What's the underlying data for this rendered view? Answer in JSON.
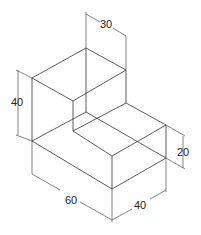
{
  "diagram": {
    "type": "isometric L-block with dimensions",
    "dimensions": {
      "top_width": "30",
      "height_total": "40",
      "step_height": "20",
      "length": "60",
      "depth": "40"
    }
  }
}
